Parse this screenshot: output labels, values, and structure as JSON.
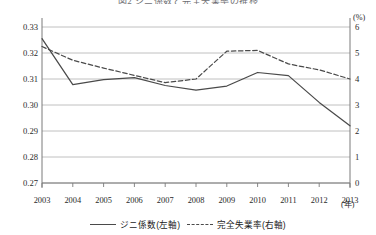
{
  "title": "図2 ジニ係数と完全失業率の推移",
  "axes": {
    "left_ticks": [
      "0.33",
      "0.32",
      "0.31",
      "0.30",
      "0.29",
      "0.28",
      "0.27"
    ],
    "right_ticks": [
      "6",
      "5",
      "4",
      "3",
      "2",
      "1",
      "0"
    ],
    "right_unit": "(%)",
    "x_unit": "(年)"
  },
  "legend": {
    "series1_label": "ジニ係数(左軸)",
    "series2_label": "完全失業率(右軸)"
  },
  "colors": {
    "line": "#4a4a4a",
    "grid": "#b9b9b9",
    "axis": "#7a7a7a",
    "text": "#1a1a1a"
  },
  "chart_data": {
    "type": "line",
    "title": "図2 ジニ係数と完全失業率の推移",
    "xlabel": "(年)",
    "ylabel": "",
    "x": [
      "2003",
      "2004",
      "2005",
      "2006",
      "2007",
      "2008",
      "2009",
      "2010",
      "2011",
      "2012",
      "2013"
    ],
    "grid": true,
    "legend_position": "bottom",
    "y_left": {
      "label": "ジニ係数",
      "ticks": [
        0.27,
        0.28,
        0.29,
        0.3,
        0.31,
        0.32,
        0.33
      ],
      "ylim": [
        0.27,
        0.33
      ],
      "tick_labels": [
        "0.27",
        "0.28",
        "0.29",
        "0.30",
        "0.31",
        "0.32",
        "0.33"
      ]
    },
    "y_right": {
      "label": "完全失業率",
      "unit": "(%)",
      "ticks": [
        0,
        1,
        2,
        3,
        4,
        5,
        6
      ],
      "ylim": [
        0,
        6
      ],
      "tick_labels": [
        "0",
        "1",
        "2",
        "3",
        "4",
        "5",
        "6"
      ]
    },
    "series": [
      {
        "name": "ジニ係数(左軸)",
        "axis": "left",
        "style": "solid",
        "color": "#4a4a4a",
        "values": [
          0.3255,
          0.3078,
          0.3098,
          0.3105,
          0.3075,
          0.3057,
          0.3073,
          0.3125,
          0.3113,
          0.301,
          0.292
        ]
      },
      {
        "name": "完全失業率(右軸)",
        "axis": "right",
        "style": "dashed",
        "color": "#4a4a4a",
        "values": [
          5.25,
          4.72,
          4.42,
          4.14,
          3.86,
          4.0,
          5.07,
          5.1,
          4.58,
          4.35,
          4.0
        ]
      }
    ]
  }
}
